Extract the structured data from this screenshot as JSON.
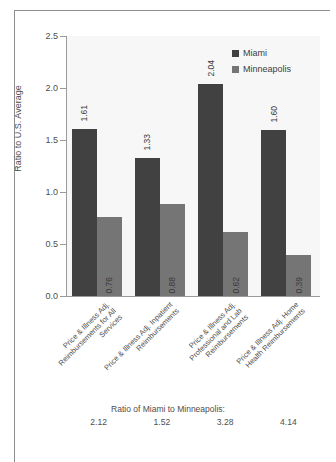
{
  "chart_data": {
    "type": "bar",
    "title": "",
    "xlabel": "",
    "ylabel": "Ratio to U.S. Average",
    "ylim": [
      0.0,
      2.5
    ],
    "ytick_labels": [
      "0.0",
      "0.5",
      "1.0",
      "1.5",
      "2.0",
      "2.5"
    ],
    "ytick_values": [
      0.0,
      0.5,
      1.0,
      1.5,
      2.0,
      2.5
    ],
    "grid": false,
    "legend_position": "top-right",
    "categories": [
      "Price & Illness Adj. Reimbursements for All Services",
      "Price & Illness Adj. Inpatient Reimbursements",
      "Price & Illness Adj. Professional and Lab Reimbursements",
      "Price & Illness Adj. Home Health Reimbursements"
    ],
    "series": [
      {
        "name": "Miami",
        "color": "#414141",
        "values": [
          1.61,
          1.33,
          2.04,
          1.6
        ],
        "value_labels": [
          "1.61",
          "1.33",
          "2.04",
          "1.60"
        ]
      },
      {
        "name": "Minneapolis",
        "color": "#757575",
        "values": [
          0.76,
          0.88,
          0.62,
          0.39
        ],
        "value_labels": [
          "0.76",
          "0.88",
          "0.62",
          "0.39"
        ]
      }
    ]
  },
  "legend": {
    "items": [
      {
        "label": "Miami"
      },
      {
        "label": "Minneapolis"
      }
    ]
  },
  "footer": {
    "title": "Ratio of Miami to Minneapolis:",
    "values": [
      "2.12",
      "1.52",
      "3.28",
      "4.14"
    ]
  }
}
